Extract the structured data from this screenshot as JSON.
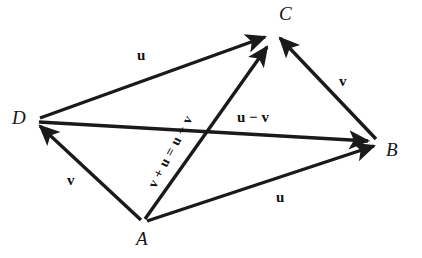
{
  "figure": {
    "background_color": "#ffffff",
    "stroke_color": "#1a1a1a",
    "vertices": [
      {
        "name": "A",
        "label": "A",
        "x": 143,
        "y": 222,
        "label_x": 136,
        "label_y": 229
      },
      {
        "name": "B",
        "label": "B",
        "x": 378,
        "y": 142,
        "label_x": 386,
        "label_y": 140
      },
      {
        "name": "C",
        "label": "C",
        "x": 272,
        "y": 30,
        "label_x": 279,
        "label_y": 4
      },
      {
        "name": "D",
        "label": "D",
        "x": 36,
        "y": 120,
        "label_x": 12,
        "label_y": 108
      }
    ],
    "vectors": [
      {
        "name": "vector-DC",
        "from": "D",
        "to": "C",
        "label": "u",
        "label_x": 137,
        "label_y": 48,
        "rotation": 0
      },
      {
        "name": "vector-AB",
        "from": "A",
        "to": "B",
        "label": "u",
        "label_x": 276,
        "label_y": 190,
        "rotation": 0
      },
      {
        "name": "vector-AD",
        "from": "A",
        "to": "D",
        "label": "v",
        "label_x": 67,
        "label_y": 173,
        "rotation": 0
      },
      {
        "name": "vector-BC",
        "from": "B",
        "to": "C",
        "label": "v",
        "label_x": 339,
        "label_y": 74,
        "rotation": 0
      },
      {
        "name": "vector-DB",
        "from": "D",
        "to": "B",
        "label": "u − v",
        "label_x": 237,
        "label_y": 110,
        "rotation": 0
      },
      {
        "name": "vector-AC",
        "from": "A",
        "to": "C",
        "label": "v + u = u + v",
        "label_x": 152,
        "label_y": 180,
        "rotation": -62
      }
    ],
    "equation_text": "v + u = u + v",
    "difference_text": "u − v"
  }
}
